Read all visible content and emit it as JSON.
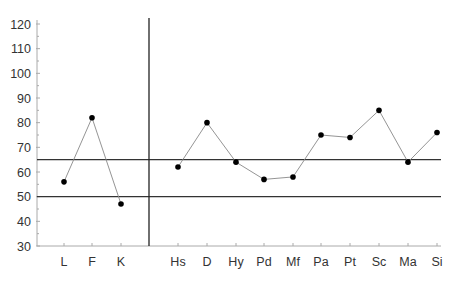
{
  "chart_data": {
    "type": "line",
    "title": "",
    "xlabel": "",
    "ylabel": "",
    "ylim": [
      30,
      120
    ],
    "yticks": [
      30,
      40,
      50,
      60,
      70,
      80,
      90,
      100,
      110,
      120
    ],
    "grid": false,
    "legend": null,
    "reference_lines": [
      50,
      65
    ],
    "groups": [
      {
        "name": "validity",
        "categories": [
          "L",
          "F",
          "K"
        ],
        "values": [
          56,
          82,
          47
        ]
      },
      {
        "name": "clinical",
        "categories": [
          "Hs",
          "D",
          "Hy",
          "Pd",
          "Mf",
          "Pa",
          "Pt",
          "Sc",
          "Ma",
          "Si"
        ],
        "values": [
          62,
          80,
          64,
          57,
          58,
          75,
          74,
          85,
          64,
          76
        ]
      }
    ]
  },
  "colors": {
    "line": "#888888",
    "marker": "#000000",
    "reference": "#333333",
    "axis": "#aaaaaa",
    "divider": "#222222"
  }
}
